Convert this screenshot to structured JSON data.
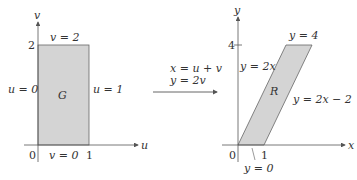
{
  "left_panel": {
    "axes": {
      "horizontal": "u",
      "vertical": "v"
    },
    "region_label": "G",
    "ticks": {
      "origin": "0",
      "u_tick": "1",
      "v_tick": "2"
    },
    "boundaries": {
      "top": "v = 2",
      "bottom": "v = 0",
      "left": "u = 0",
      "right": "u = 1"
    }
  },
  "transformation": {
    "eq1": "x = u + v",
    "eq2": "y = 2v"
  },
  "right_panel": {
    "axes": {
      "horizontal": "x",
      "vertical": "y"
    },
    "region_label": "R",
    "ticks": {
      "origin": "0",
      "x_tick": "1",
      "y_tick": "4"
    },
    "boundaries": {
      "top": "y = 4",
      "bottom": "y = 0",
      "left": "y = 2x",
      "right": "y = 2x − 2"
    }
  },
  "colors": {
    "fill": "#d4d4d4",
    "line": "#555555",
    "text": "#333333"
  }
}
